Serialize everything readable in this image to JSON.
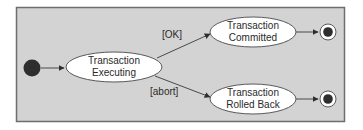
{
  "diagram": {
    "type": "UML state machine",
    "colors": {
      "background": "#d3d3d3",
      "frame_border": "#6e6e6e",
      "state_fill": "#ffffff",
      "state_stroke": "#5a5a5a",
      "initial_fill": "#2e2e2e",
      "edge": "#4a4a4a"
    },
    "initial_state": {
      "id": "start"
    },
    "states": [
      {
        "id": "executing",
        "line1": "Transaction",
        "line2": "Executing"
      },
      {
        "id": "committed",
        "line1": "Transaction",
        "line2": "Committed"
      },
      {
        "id": "rolledback",
        "line1": "Transaction",
        "line2": "Rolled Back"
      }
    ],
    "final_states": [
      {
        "id": "end-commit"
      },
      {
        "id": "end-rollback"
      }
    ],
    "transitions": [
      {
        "from": "start",
        "to": "executing",
        "guard": ""
      },
      {
        "from": "executing",
        "to": "committed",
        "guard": "[OK]"
      },
      {
        "from": "executing",
        "to": "rolledback",
        "guard": "[abort]"
      },
      {
        "from": "committed",
        "to": "end-commit",
        "guard": ""
      },
      {
        "from": "rolledback",
        "to": "end-rollback",
        "guard": ""
      }
    ]
  }
}
